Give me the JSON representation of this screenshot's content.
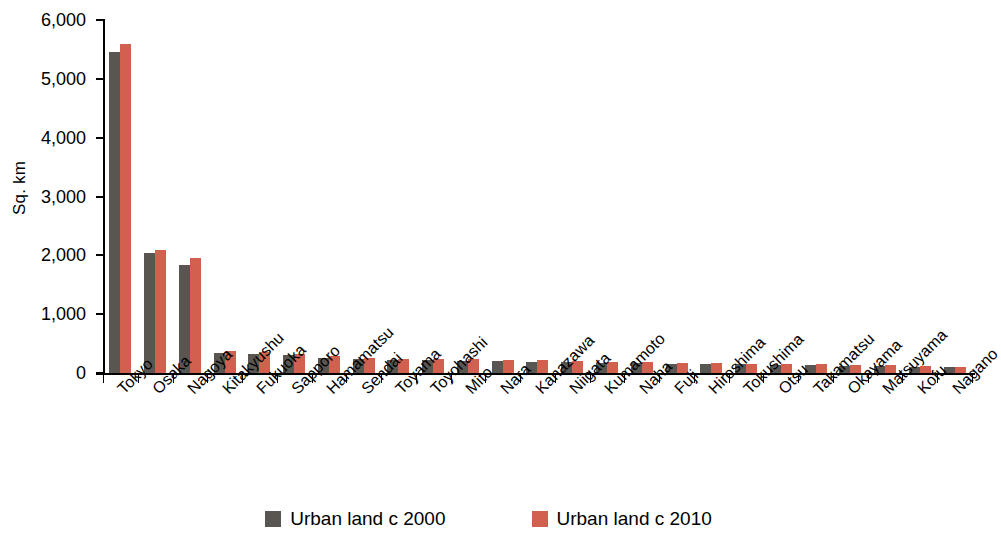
{
  "chart_data": {
    "type": "bar",
    "title": "",
    "subtitle": "",
    "xlabel": "",
    "ylabel": "Sq. km",
    "ylim": [
      0,
      6000
    ],
    "ytick_values": [
      0,
      1000,
      2000,
      3000,
      4000,
      5000,
      6000
    ],
    "ytick_labels": [
      "0",
      "1,000",
      "2,000",
      "3,000",
      "4,000",
      "5,000",
      "6,000"
    ],
    "grid": false,
    "legend_position": "bottom",
    "categories": [
      "Tokyo",
      "Osaka",
      "Nagoya",
      "Kitakyushu",
      "Fukuoka",
      "Sapporo",
      "Hamamatsu",
      "Sendai",
      "Toyama",
      "Toyohashi",
      "Mito",
      "Nara",
      "Kanazawa",
      "Niigata",
      "Kumamoto",
      "Naha",
      "Fuji",
      "Hiroshima",
      "Tokushima",
      "Otsu",
      "Takamatsu",
      "Okayama",
      "Matsuyama",
      "Kofu",
      "Nagano"
    ],
    "series": [
      {
        "name": "Urban land c 2000",
        "color": "#595651",
        "values": [
          5460,
          2040,
          1840,
          340,
          330,
          300,
          260,
          240,
          225,
          215,
          210,
          200,
          195,
          185,
          175,
          165,
          160,
          150,
          145,
          135,
          130,
          125,
          120,
          110,
          100
        ]
      },
      {
        "name": "Urban land c 2010",
        "color": "#d2604f",
        "values": [
          5590,
          2090,
          1960,
          375,
          360,
          320,
          285,
          255,
          245,
          235,
          230,
          220,
          215,
          205,
          195,
          185,
          175,
          165,
          160,
          150,
          145,
          140,
          130,
          120,
          110
        ]
      }
    ]
  },
  "legend": {
    "items": [
      {
        "label": "Urban land c 2000",
        "color": "#595651"
      },
      {
        "label": "Urban land c 2010",
        "color": "#d2604f"
      }
    ]
  },
  "colors": {
    "series_2000": "#595651",
    "series_2010": "#d2604f",
    "axis": "#000000",
    "background": "#ffffff"
  }
}
